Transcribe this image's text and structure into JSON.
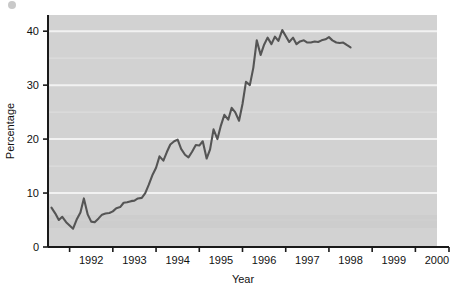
{
  "chart_data": {
    "type": "line",
    "title": "",
    "xlabel": "Year",
    "ylabel": "Percentage",
    "xlim": [
      1991.5,
      2000.5
    ],
    "ylim": [
      0,
      43
    ],
    "grid": true,
    "legend_position": "none",
    "plot_background": "#d2d2d2",
    "line_color": "#555555",
    "axis_color": "#1a1a1a",
    "gridline_color": "#f2f2f2",
    "y_ticks": [
      0,
      10,
      20,
      30,
      40
    ],
    "y_tick_labels": [
      "0",
      "10",
      "20",
      "30",
      "40"
    ],
    "y_minor_gridlines": [
      5,
      15,
      25,
      35
    ],
    "x_ticks": [
      1992,
      1993,
      1994,
      1995,
      1996,
      1997,
      1998,
      1999,
      2000
    ],
    "x_tick_labels": [
      "1992",
      "1993",
      "1994",
      "1995",
      "1996",
      "1997",
      "1998",
      "1999",
      "2000"
    ],
    "series": [
      {
        "name": "Percentage",
        "x": [
          1991.58,
          1991.67,
          1991.75,
          1991.83,
          1991.92,
          1992.0,
          1992.08,
          1992.17,
          1992.25,
          1992.33,
          1992.42,
          1992.5,
          1992.58,
          1992.67,
          1992.75,
          1992.83,
          1992.92,
          1993.0,
          1993.08,
          1993.17,
          1993.25,
          1993.33,
          1993.42,
          1993.5,
          1993.58,
          1993.67,
          1993.75,
          1993.83,
          1993.92,
          1994.0,
          1994.08,
          1994.17,
          1994.25,
          1994.33,
          1994.42,
          1994.5,
          1994.58,
          1994.67,
          1994.75,
          1994.83,
          1994.92,
          1995.0,
          1995.08,
          1995.17,
          1995.25,
          1995.33,
          1995.42,
          1995.5,
          1995.58,
          1995.67,
          1995.75,
          1995.83,
          1995.92,
          1996.0,
          1996.08,
          1996.17,
          1996.25,
          1996.33,
          1996.42,
          1996.5,
          1996.58,
          1996.67,
          1996.75,
          1996.83,
          1996.92,
          1997.0,
          1997.08,
          1997.17,
          1997.25,
          1997.33,
          1997.42,
          1997.5,
          1997.58,
          1997.67,
          1997.75,
          1997.83,
          1997.92,
          1998.0,
          1998.08,
          1998.17,
          1998.25,
          1998.33,
          1998.42,
          1998.5
        ],
        "values": [
          7.3,
          6.2,
          5.0,
          5.6,
          4.6,
          4.0,
          3.4,
          5.2,
          6.4,
          9.0,
          6.0,
          4.7,
          4.6,
          5.3,
          6.0,
          6.2,
          6.3,
          6.6,
          7.2,
          7.4,
          8.2,
          8.3,
          8.5,
          8.6,
          9.0,
          9.1,
          10.0,
          11.5,
          13.4,
          14.7,
          16.8,
          16.0,
          17.6,
          19.0,
          19.6,
          19.9,
          18.2,
          17.1,
          16.6,
          17.6,
          18.9,
          18.8,
          19.6,
          16.4,
          18.1,
          21.8,
          20.0,
          22.5,
          24.5,
          23.6,
          25.8,
          25.0,
          23.4,
          26.5,
          30.6,
          30.0,
          33.2,
          38.3,
          35.6,
          37.5,
          38.8,
          37.6,
          39.0,
          38.2,
          40.2,
          39.1,
          38.0,
          38.8,
          37.6,
          38.1,
          38.3,
          37.9,
          37.9,
          38.1,
          38.0,
          38.3,
          38.5,
          38.9,
          38.3,
          37.9,
          37.8,
          37.9,
          37.4,
          37.0
        ]
      }
    ]
  }
}
